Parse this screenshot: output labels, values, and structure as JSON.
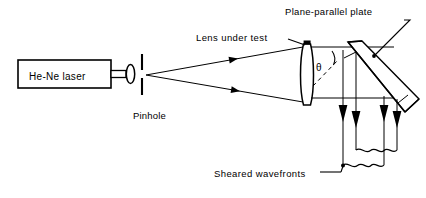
{
  "figure": {
    "type": "optical-ray-diagram",
    "background": "#ffffff",
    "stroke": "#000000"
  },
  "labels": {
    "laser": "He-Ne laser",
    "pinhole": "Pinhole",
    "lens": "Lens under test",
    "plate": "Plane-parallel plate",
    "sheared": "Sheared wavefronts",
    "theta": "θ"
  },
  "components": {
    "laser_box": {
      "name": "He-Ne laser",
      "x": 18,
      "y": 60,
      "w": 93,
      "h": 28
    },
    "output_tube": {
      "x": 111,
      "y": 70,
      "w": 16,
      "h": 8
    },
    "focus_lens": {
      "cx": 130,
      "cy": 74,
      "rx": 4,
      "ry": 9
    },
    "pinhole_aperture": {
      "x": 142,
      "top_y": 56,
      "bottom_y": 94,
      "gap_y": 74
    },
    "lens_under_test": {
      "cx": 307,
      "cy": 74,
      "half_height": 30,
      "bulge": 5
    },
    "plate": {
      "tilt_deg": 45,
      "label": "Plane-parallel plate"
    },
    "sheared_beam_arrows": [
      343,
      356,
      384,
      397
    ],
    "wavefront_braces": 2
  },
  "rays": {
    "diverging_from_pinhole": 2,
    "arrow_marks_on_rays": 2,
    "optical_axis_y": 98
  }
}
